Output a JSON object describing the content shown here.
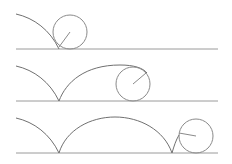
{
  "figure": {
    "colors": {
      "ground": "#9a9a9a",
      "curve": "#707070",
      "wheel": "#8a8a8a",
      "background": "#ffffff"
    },
    "panels": [
      {
        "stage": 1,
        "ground": {
          "x1": 16,
          "x2": 218,
          "y": 49
        },
        "circle": {
          "cx": 70,
          "cy": 32,
          "r": 17
        },
        "spoke_end": {
          "x": 59,
          "y": 47
        },
        "curve_path": "M16,14 C34,18 50,30 59,49"
      },
      {
        "stage": 2,
        "ground": {
          "x1": 16,
          "x2": 218,
          "y": 101
        },
        "circle": {
          "cx": 133,
          "cy": 84,
          "r": 17
        },
        "spoke_end": {
          "x": 146,
          "y": 73
        },
        "curve_path": "M16,66 C34,70 50,82 59,101 C66,82 85,65 120,65 C134,65 143,68 147,73"
      },
      {
        "stage": 3,
        "ground": {
          "x1": 16,
          "x2": 218,
          "y": 153
        },
        "circle": {
          "cx": 196,
          "cy": 136,
          "r": 17
        },
        "spoke_end": {
          "x": 179,
          "y": 133
        },
        "curve_path": "M16,118 C34,122 50,134 59,153 C66,130 90,117 115,117 C140,117 164,130 172,153 C174,146 176,140 179,135"
      }
    ]
  }
}
